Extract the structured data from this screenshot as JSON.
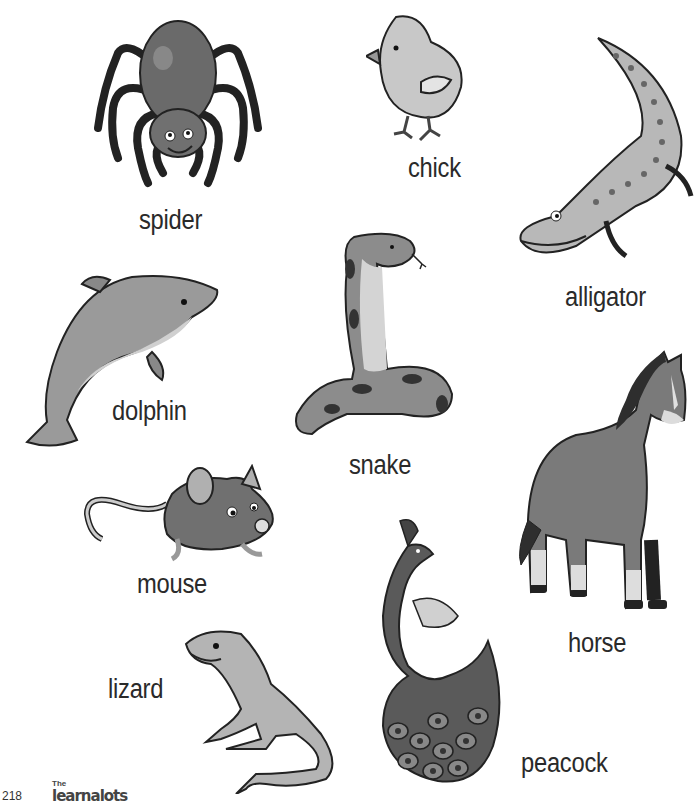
{
  "page": {
    "number": "218",
    "publisher_logo": {
      "top": "The",
      "main": "learnalots"
    }
  },
  "animals": [
    {
      "id": "spider",
      "label": "spider"
    },
    {
      "id": "chick",
      "label": "chick"
    },
    {
      "id": "alligator",
      "label": "alligator"
    },
    {
      "id": "dolphin",
      "label": "dolphin"
    },
    {
      "id": "snake",
      "label": "snake"
    },
    {
      "id": "horse",
      "label": "horse"
    },
    {
      "id": "mouse",
      "label": "mouse"
    },
    {
      "id": "lizard",
      "label": "lizard"
    },
    {
      "id": "peacock",
      "label": "peacock"
    }
  ],
  "colors": {
    "outline": "#1a1a1a",
    "dark": "#555555",
    "mid": "#8a8a8a",
    "light": "#b5b5b5",
    "pale": "#d6d6d6"
  }
}
